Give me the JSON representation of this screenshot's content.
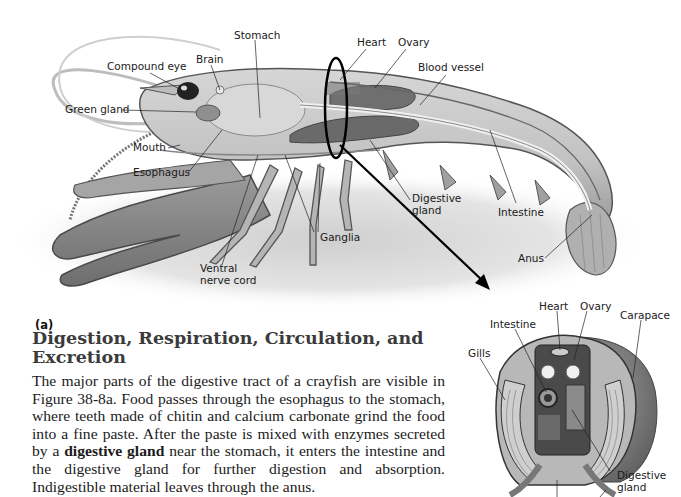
{
  "figure_a": {
    "tag": "(a)",
    "labels": {
      "stomach": "Stomach",
      "brain": "Brain",
      "compound_eye": "Compound eye",
      "heart": "Heart",
      "ovary": "Ovary",
      "blood_vessel": "Blood vessel",
      "green_gland": "Green gland",
      "mouth": "Mouth",
      "esophagus": "Esophagus",
      "digestive_gland_1": "Digestive",
      "digestive_gland_2": "gland",
      "intestine": "Intestine",
      "ganglia": "Ganglia",
      "ventral_1": "Ventral",
      "ventral_2": "nerve cord",
      "anus": "Anus"
    }
  },
  "figure_b": {
    "labels": {
      "heart": "Heart",
      "ovary": "Ovary",
      "carapace": "Carapace",
      "intestine": "Intestine",
      "gills": "Gills",
      "digestive_gland_1": "Digestive",
      "digestive_gland_2": "gland"
    }
  },
  "section": {
    "heading": "Digestion, Respiration, Circulation, and Excretion",
    "paragraph_before_bold": "The major parts of the digestive tract of a crayfish are visible in Figure 38-8a. Food passes through the esophagus to the stomach, where teeth made of chitin and calcium carbonate grind the food into a fine paste. After the paste is mixed with enzymes secreted by a ",
    "bold_term": "digestive gland",
    "paragraph_after_bold": " near the stomach, it enters the intestine and the digestive gland for further digestion and absorption. Indigestible material leaves through the anus."
  }
}
